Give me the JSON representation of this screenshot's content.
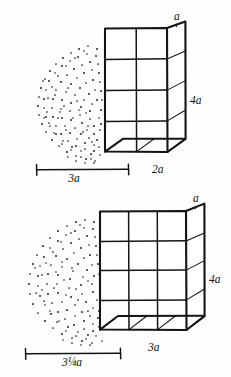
{
  "figure": {
    "background_color": "#fefefe",
    "ink_color": "#141414",
    "stipple_color": "#161616"
  },
  "panels": [
    {
      "id": "top-panel",
      "name": "Top figure: 2-wide box with 3a dome",
      "box": {
        "front_columns": 2,
        "front_rows": 4,
        "depth_units": 1,
        "labels": {
          "depth_top": "a",
          "height_right": "4a",
          "width_bottom": "2a"
        }
      },
      "dome": {
        "label": "3a",
        "shape": "half-ellipse stipple"
      },
      "dimension": {
        "value": "3a",
        "orientation": "horizontal",
        "has_end_ticks": true
      }
    },
    {
      "id": "bottom-panel",
      "name": "Bottom figure: 3-wide box with 3 1/4 a dome",
      "box": {
        "front_columns": 3,
        "front_rows": 4,
        "depth_units": 1,
        "labels": {
          "depth_top": "a",
          "height_right": "4a",
          "width_bottom": "3a"
        }
      },
      "dome": {
        "label": "3¼a",
        "shape": "half-ellipse stipple"
      },
      "dimension": {
        "value": "3¼a",
        "orientation": "horizontal",
        "has_end_ticks": true
      }
    }
  ],
  "labels": {
    "top_depth_a": "a",
    "top_height_4a": "4a",
    "top_width_2a": "2a",
    "top_dome_3a": "3a",
    "bottom_depth_a": "a",
    "bottom_height_4a": "4a",
    "bottom_width_3a": "3a",
    "bottom_dome_3quarter_a": "3¼a"
  }
}
